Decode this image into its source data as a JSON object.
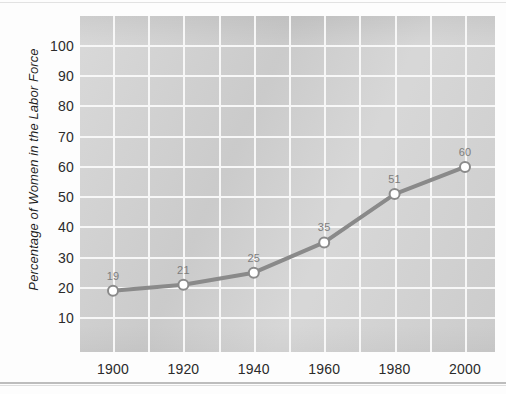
{
  "chart_data": {
    "type": "line",
    "title": "",
    "subtitle": "",
    "xlabel": "",
    "ylabel": "Percentage of Women in the Labor Force",
    "x": [
      1900,
      1920,
      1940,
      1960,
      1980,
      2000
    ],
    "xtick_labels": [
      "1900",
      "1920",
      "1940",
      "1960",
      "1980",
      "2000"
    ],
    "values": [
      19,
      21,
      25,
      35,
      51,
      60
    ],
    "point_labels": [
      "19",
      "21",
      "25",
      "35",
      "51",
      "60"
    ],
    "ytick_labels": [
      "100",
      "90",
      "80",
      "70",
      "60",
      "50",
      "40",
      "30",
      "20",
      "10"
    ],
    "ytick_values": [
      100,
      90,
      80,
      70,
      60,
      50,
      40,
      30,
      20,
      10
    ],
    "xlim": [
      1890,
      2010
    ],
    "ylim": [
      0,
      110
    ],
    "grid": true,
    "grid_major_y": [
      10,
      20,
      30,
      40,
      50,
      60,
      70,
      80,
      90,
      100
    ],
    "legend": null,
    "legend_position": "none",
    "series": [
      {
        "name": "Percentage of Women in the Labor Force",
        "values": [
          19,
          21,
          25,
          35,
          51,
          60
        ]
      }
    ],
    "colors": {
      "plot_background": "#d2d2d2",
      "gridline": "#f7f7f7",
      "line": "#8a8a8a",
      "marker_fill": "#ffffff",
      "marker_edge": "#8a8a8a",
      "tick_text": "#2b2b2b",
      "point_label_text": "#7d7d7d",
      "axis_title_text": "#1f1f1f",
      "page_background": "#ffffff"
    }
  }
}
